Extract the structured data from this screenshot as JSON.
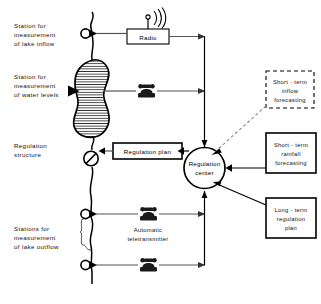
{
  "diagram": {
    "background_color": "#ffffff",
    "line_color": "#000000",
    "connector_color": "#555555"
  },
  "left_labels": [
    {
      "id": "station-lake-inflow",
      "lines": [
        "Station for",
        "measurement",
        "of lake inflow"
      ]
    },
    {
      "id": "station-water-levels",
      "lines": [
        "Station for",
        "measurement",
        "of water levels"
      ]
    },
    {
      "id": "regulation-structure",
      "lines": [
        "Regulation",
        "structure"
      ]
    },
    {
      "id": "stations-lake-outflow",
      "lines": [
        "Stations for",
        "measurement",
        "of lake outflow"
      ]
    }
  ],
  "nodes": {
    "radio": {
      "label": "Radio",
      "icon": "antenna-icon"
    },
    "regulation_plan": {
      "label": "Regulation plan"
    },
    "regulation_center": {
      "lines": [
        "Regulation",
        "center"
      ]
    },
    "teletransmitter": {
      "lines": [
        "Automatic",
        "teletransmitter"
      ],
      "icon": "telephone-icon"
    }
  },
  "right_boxes": [
    {
      "id": "short-term-inflow-forecasting",
      "lines": [
        "Short - term",
        "inflow",
        "forecasting"
      ],
      "border": "dashed"
    },
    {
      "id": "short-term-rainfall-forecasting",
      "lines": [
        "Short - term",
        "rainfall",
        "forecasting"
      ],
      "border": "solid"
    },
    {
      "id": "long-term-regulation-plan",
      "lines": [
        "Long - term",
        "regulation",
        "plan"
      ],
      "border": "solid"
    }
  ],
  "icons": {
    "telephone_top": "telephone-icon",
    "telephone_mid": "telephone-icon",
    "telephone_bottom": "telephone-icon",
    "valve": "valve-icon",
    "lake": "lake-shape",
    "gauge_inflow": "gauge-station-icon",
    "gauge_level": "gauge-station-icon",
    "gauge_outflow_upper": "gauge-station-icon",
    "gauge_outflow_lower": "gauge-station-icon"
  }
}
